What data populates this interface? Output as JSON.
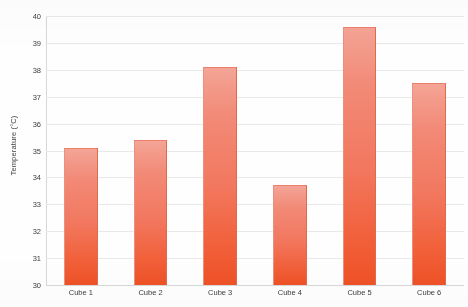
{
  "chart_data": {
    "type": "bar",
    "title": "",
    "xlabel": "",
    "ylabel": "Temperature (°C)",
    "categories": [
      "Cube 1",
      "Cube 2",
      "Cube 3",
      "Cube 4",
      "Cube 5",
      "Cube 6"
    ],
    "values": [
      35.1,
      35.4,
      38.1,
      33.7,
      39.6,
      37.5
    ],
    "ylim": [
      30,
      40
    ],
    "ytick_labels": [
      "40",
      "39",
      "38",
      "37",
      "36",
      "35",
      "34",
      "33",
      "32",
      "31",
      "30"
    ],
    "ytick_values": [
      40,
      39,
      38,
      37,
      36,
      35,
      34,
      33,
      32,
      31,
      30
    ],
    "grid": true,
    "grid_axis": "y",
    "legend": false,
    "bar_color_top": "#f4a496",
    "bar_color_bottom": "#ef5126",
    "gridline_color": "#e9e9ea",
    "background_color": "#ffffff"
  },
  "axes": {
    "y_title": "Temperature (°C)"
  }
}
